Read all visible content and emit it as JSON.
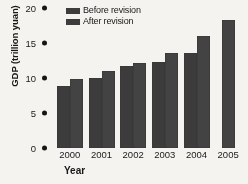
{
  "chart_data": {
    "type": "bar",
    "title": "",
    "xlabel": "Year",
    "ylabel": "GDP (trillion yuan)",
    "categories": [
      "2000",
      "2001",
      "2002",
      "2003",
      "2004",
      "2005"
    ],
    "series": [
      {
        "name": "Before revision",
        "values": [
          8.9,
          10.0,
          11.7,
          12.3,
          13.6,
          null
        ]
      },
      {
        "name": "After revision",
        "values": [
          9.9,
          11.0,
          12.2,
          13.6,
          16.0,
          18.3
        ]
      }
    ],
    "ylim": [
      0,
      20
    ],
    "yticks": [
      0,
      5,
      10,
      15,
      20
    ],
    "ytick_labels": [
      "0",
      "5",
      "10",
      "15",
      "20"
    ],
    "grid": false,
    "legend_position": "top-left",
    "bar_color": "#3f3f3f",
    "background_color": "#f4f3f0"
  },
  "axis": {
    "y_title": "GDP (trillion yuan)",
    "x_title": "Year"
  },
  "legend": {
    "entries": [
      {
        "label": "Before revision",
        "swatch": "#3f3f3f"
      },
      {
        "label": "After revision",
        "swatch": "#3f3f3f"
      }
    ]
  }
}
